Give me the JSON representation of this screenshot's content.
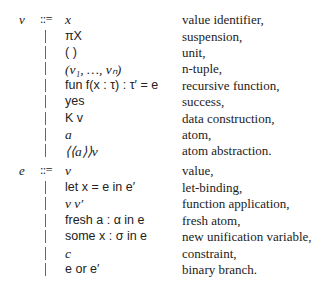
{
  "grammar": {
    "v": {
      "nonterminal": "v",
      "defop": "::=",
      "productions": [
        {
          "expr": "x",
          "desc": "value identifier,"
        },
        {
          "expr": "πX",
          "desc": "suspension,"
        },
        {
          "expr": "( )",
          "desc": "unit,"
        },
        {
          "expr": "(v₁, …, vₙ)",
          "desc": "n-tuple,"
        },
        {
          "expr": "fun f(x : τ) : τ′ = e",
          "desc": "recursive function,"
        },
        {
          "expr": "yes",
          "desc": "success,"
        },
        {
          "expr": "K v",
          "desc": "data construction,"
        },
        {
          "expr": "a",
          "desc": "atom,"
        },
        {
          "expr": "⟨⟨a⟩⟩v",
          "desc": "atom abstraction."
        }
      ]
    },
    "e": {
      "nonterminal": "e",
      "defop": "::=",
      "productions": [
        {
          "expr": "v",
          "desc": "value,"
        },
        {
          "expr": "let x = e in e′",
          "desc": "let-binding,"
        },
        {
          "expr": "v v′",
          "desc": "function application,"
        },
        {
          "expr": "fresh a : α in e",
          "desc": "fresh atom,"
        },
        {
          "expr": "some x : σ in e",
          "desc": "new unification variable,"
        },
        {
          "expr": "c",
          "desc": "constraint,"
        },
        {
          "expr": "e or e′",
          "desc": "binary branch."
        }
      ]
    }
  }
}
